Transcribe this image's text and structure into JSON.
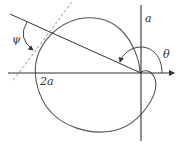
{
  "diagram": {
    "labels": {
      "psi": "ψ",
      "theta": "θ",
      "a": "a",
      "two_a": "2a"
    },
    "colors": {
      "curve": "#555555",
      "axes": "#333333",
      "tangent": "#9a9a9a",
      "radius": "#333333"
    },
    "elements": [
      "cardioid-curve",
      "x-axis",
      "y-axis",
      "radius-line",
      "tangent-line",
      "psi-arc",
      "theta-arc"
    ]
  }
}
